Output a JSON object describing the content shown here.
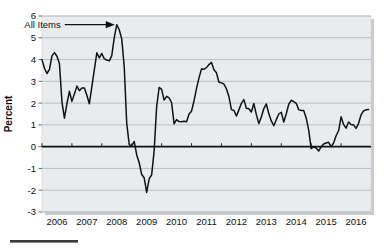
{
  "figure": {
    "source_rule_label": "source-underline"
  },
  "chart_data": {
    "type": "line",
    "title": "",
    "subtitle": "",
    "xlabel": "",
    "ylabel": "Percent",
    "xlim": [
      2006.0,
      2017.0
    ],
    "ylim": [
      -3,
      6
    ],
    "yticks": [
      -3,
      -2,
      -1,
      0,
      1,
      2,
      3,
      4,
      5,
      6
    ],
    "ytick_labels": [
      "-3",
      "-2",
      "-1",
      "0",
      "1",
      "2",
      "3",
      "4",
      "5",
      "6"
    ],
    "xticks": [
      2006,
      2007,
      2008,
      2009,
      2010,
      2011,
      2012,
      2013,
      2014,
      2015,
      2016
    ],
    "xtick_labels": [
      "2006",
      "2007",
      "2008",
      "2009",
      "2010",
      "2011",
      "2012",
      "2013",
      "2014",
      "2015",
      "2016"
    ],
    "grid": true,
    "grid_axis": "y",
    "legend": false,
    "zero_line": true,
    "plot_background": "#e9ecee",
    "line_color": "#111111",
    "annotations": [
      {
        "text": "All Items",
        "x": 2008.5,
        "y": 5.6,
        "arrow": "right"
      }
    ],
    "series": [
      {
        "name": "All Items",
        "x": [
          2006.0,
          2006.083,
          2006.167,
          2006.25,
          2006.333,
          2006.417,
          2006.5,
          2006.583,
          2006.667,
          2006.75,
          2006.833,
          2006.917,
          2007.0,
          2007.083,
          2007.167,
          2007.25,
          2007.333,
          2007.417,
          2007.5,
          2007.583,
          2007.667,
          2007.75,
          2007.833,
          2007.917,
          2008.0,
          2008.083,
          2008.167,
          2008.25,
          2008.333,
          2008.417,
          2008.5,
          2008.583,
          2008.667,
          2008.75,
          2008.833,
          2008.917,
          2009.0,
          2009.083,
          2009.167,
          2009.25,
          2009.333,
          2009.417,
          2009.5,
          2009.583,
          2009.667,
          2009.75,
          2009.833,
          2009.917,
          2010.0,
          2010.083,
          2010.167,
          2010.25,
          2010.333,
          2010.417,
          2010.5,
          2010.583,
          2010.667,
          2010.75,
          2010.833,
          2010.917,
          2011.0,
          2011.083,
          2011.167,
          2011.25,
          2011.333,
          2011.417,
          2011.5,
          2011.583,
          2011.667,
          2011.75,
          2011.833,
          2011.917,
          2012.0,
          2012.083,
          2012.167,
          2012.25,
          2012.333,
          2012.417,
          2012.5,
          2012.583,
          2012.667,
          2012.75,
          2012.833,
          2012.917,
          2013.0,
          2013.083,
          2013.167,
          2013.25,
          2013.333,
          2013.417,
          2013.5,
          2013.583,
          2013.667,
          2013.75,
          2013.833,
          2013.917,
          2014.0,
          2014.083,
          2014.167,
          2014.25,
          2014.333,
          2014.417,
          2014.5,
          2014.583,
          2014.667,
          2014.75,
          2014.833,
          2014.917,
          2015.0,
          2015.083,
          2015.167,
          2015.25,
          2015.333,
          2015.417,
          2015.5,
          2015.583,
          2015.667,
          2015.75,
          2015.833,
          2015.917,
          2016.0,
          2016.083,
          2016.167,
          2016.25,
          2016.333,
          2016.417,
          2016.5,
          2016.583,
          2016.667,
          2016.75,
          2016.833,
          2016.917
        ],
        "values": [
          3.99,
          3.6,
          3.36,
          3.55,
          4.17,
          4.32,
          4.15,
          3.82,
          2.06,
          1.31,
          1.97,
          2.54,
          2.08,
          2.42,
          2.78,
          2.57,
          2.69,
          2.69,
          2.36,
          1.97,
          2.76,
          3.54,
          4.31,
          4.08,
          4.28,
          4.03,
          3.98,
          3.94,
          4.18,
          5.02,
          5.6,
          5.37,
          4.94,
          3.66,
          1.07,
          0.09,
          0.03,
          0.24,
          -0.38,
          -0.74,
          -1.28,
          -1.43,
          -2.1,
          -1.48,
          -1.29,
          -0.18,
          1.84,
          2.72,
          2.63,
          2.14,
          2.31,
          2.24,
          2.02,
          1.05,
          1.24,
          1.15,
          1.14,
          1.17,
          1.14,
          1.5,
          1.63,
          2.11,
          2.68,
          3.16,
          3.57,
          3.56,
          3.63,
          3.77,
          3.87,
          3.53,
          3.39,
          2.96,
          2.93,
          2.87,
          2.65,
          2.3,
          1.7,
          1.66,
          1.41,
          1.69,
          1.99,
          2.16,
          1.76,
          1.74,
          1.59,
          1.98,
          1.47,
          1.06,
          1.36,
          1.75,
          1.96,
          1.52,
          1.18,
          0.96,
          1.24,
          1.5,
          1.58,
          1.13,
          1.51,
          1.95,
          2.13,
          2.07,
          1.99,
          1.7,
          1.66,
          1.66,
          1.32,
          0.76,
          -0.09,
          0.0,
          -0.07,
          -0.2,
          0.0,
          0.12,
          0.17,
          0.2,
          0.0,
          0.17,
          0.5,
          0.73,
          1.37,
          1.02,
          0.85,
          1.13,
          1.02,
          1.0,
          0.84,
          1.06,
          1.46,
          1.64,
          1.69,
          1.71
        ]
      }
    ]
  }
}
